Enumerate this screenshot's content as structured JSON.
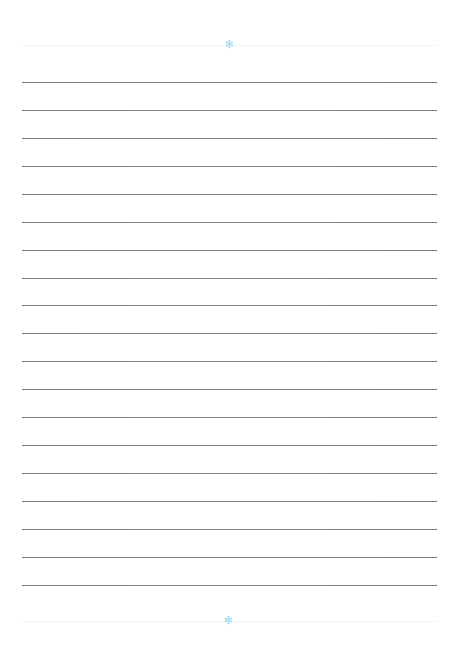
{
  "page": {
    "type": "lined-paper",
    "background": "#ffffff",
    "line_color": "#808080",
    "accent_color": "#9fdcee",
    "line_count": 19,
    "line_y_positions": [
      82,
      110,
      138,
      166,
      194,
      222,
      250,
      278,
      305,
      333,
      361,
      389,
      417,
      445,
      473,
      501,
      529,
      557,
      585
    ]
  },
  "header_ornament": {
    "icon": "snowflake-icon",
    "glyph": "✻",
    "y": 45
  },
  "footer_ornament": {
    "icon": "snowflake-icon",
    "glyph": "✻",
    "y": 621
  }
}
